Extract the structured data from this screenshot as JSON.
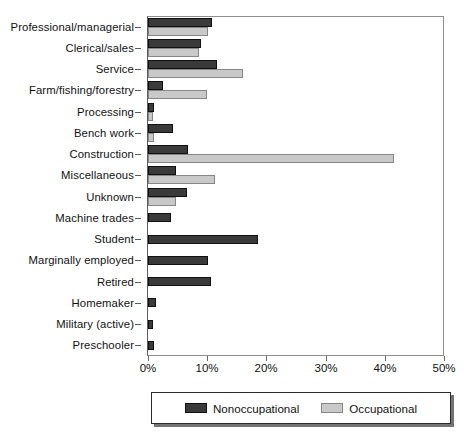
{
  "chart_data": {
    "type": "bar",
    "orientation": "horizontal",
    "title": "",
    "subtitle": "",
    "xlabel": "",
    "ylabel": "",
    "xlim": [
      0,
      50
    ],
    "xticks": [
      0,
      10,
      20,
      30,
      40,
      50
    ],
    "xtick_labels": [
      "0%",
      "10%",
      "20%",
      "30%",
      "40%",
      "50%"
    ],
    "grid": false,
    "legend_position": "bottom",
    "categories": [
      "Professional/managerial",
      "Clerical/sales",
      "Service",
      "Farm/fishing/forestry",
      "Processing",
      "Bench work",
      "Construction",
      "Miscellaneous",
      "Unknown",
      "Machine trades",
      "Student",
      "Marginally employed",
      "Retired",
      "Homemaker",
      "Military (active)",
      "Preschooler"
    ],
    "series": [
      {
        "name": "Nonoccupational",
        "color": "#3a3a3a",
        "values": [
          10.8,
          8.9,
          11.7,
          2.6,
          1.0,
          4.3,
          6.7,
          4.8,
          6.6,
          3.9,
          18.6,
          10.2,
          10.7,
          1.3,
          0.8,
          1.0
        ]
      },
      {
        "name": "Occupational",
        "color": "#c9c9c9",
        "values": [
          10.2,
          8.6,
          16.1,
          10.0,
          0.8,
          1.0,
          41.5,
          11.4,
          4.7,
          0.0,
          0.0,
          0.0,
          0.0,
          0.0,
          0.0,
          0.0
        ]
      }
    ]
  },
  "legend": {
    "entries": [
      {
        "label": "Nonoccupational",
        "swatch": "nonocc"
      },
      {
        "label": "Occupational",
        "swatch": "occ"
      }
    ]
  }
}
